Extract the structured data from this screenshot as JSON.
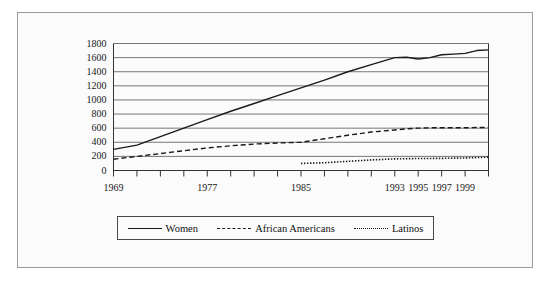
{
  "chart_data": {
    "type": "line",
    "title": "",
    "subtitle": "",
    "xlabel": "",
    "ylabel": "",
    "xlim": [
      1969,
      2001
    ],
    "ylim": [
      0,
      1800
    ],
    "grid": true,
    "grid_axis": "y",
    "legend_position": "bottom",
    "y_ticks": [
      0,
      200,
      400,
      600,
      800,
      1000,
      1200,
      1400,
      1600,
      1800
    ],
    "x_ticks": [
      1969,
      1971,
      1973,
      1975,
      1977,
      1979,
      1981,
      1983,
      1985,
      1987,
      1989,
      1991,
      1993,
      1995,
      1997,
      1999,
      2001
    ],
    "x_tick_labels": [
      "1969",
      "",
      "",
      "",
      "1977",
      "",
      "",
      "",
      "1985",
      "",
      "",
      "",
      "1993",
      "1995",
      "1997",
      "1999",
      ""
    ],
    "x_tick_labels_shown": [
      "1969",
      "1977",
      "1985",
      "1993",
      "1995",
      "1997",
      "1999"
    ],
    "series": [
      {
        "name": "Women",
        "style": "solid",
        "color": "#1a1a1a",
        "x": [
          1969,
          1971,
          1973,
          1975,
          1977,
          1979,
          1981,
          1983,
          1985,
          1987,
          1989,
          1991,
          1993,
          1994,
          1995,
          1996,
          1997,
          1998,
          1999,
          2000,
          2001
        ],
        "values": [
          300,
          360,
          480,
          600,
          720,
          840,
          950,
          1060,
          1170,
          1280,
          1400,
          1500,
          1600,
          1605,
          1580,
          1600,
          1640,
          1650,
          1660,
          1700,
          1710
        ]
      },
      {
        "name": "African Americans",
        "style": "dashed",
        "color": "#1a1a1a",
        "x": [
          1969,
          1971,
          1973,
          1975,
          1977,
          1979,
          1981,
          1983,
          1985,
          1987,
          1989,
          1991,
          1993,
          1994,
          1995,
          1996,
          1997,
          1998,
          1999,
          2000,
          2001
        ],
        "values": [
          160,
          200,
          240,
          280,
          320,
          350,
          375,
          390,
          400,
          450,
          500,
          545,
          575,
          590,
          600,
          605,
          605,
          605,
          605,
          610,
          610
        ]
      },
      {
        "name": "Latinos",
        "style": "dotted",
        "color": "#1a1a1a",
        "x": [
          1985,
          1987,
          1989,
          1991,
          1993,
          1995,
          1997,
          1999,
          2001
        ],
        "values": [
          100,
          110,
          130,
          150,
          165,
          170,
          172,
          178,
          190
        ]
      }
    ]
  },
  "legend": {
    "items": [
      {
        "label": "Women",
        "style": "solid"
      },
      {
        "label": "African Americans",
        "style": "dashed"
      },
      {
        "label": "Latinos",
        "style": "dotted"
      }
    ]
  },
  "axes": {
    "y_labels": [
      "1800",
      "1600",
      "1400",
      "1200",
      "1000",
      "800",
      "600",
      "400",
      "200",
      "0"
    ],
    "x_labels": [
      "1969",
      "1977",
      "1985",
      "1993",
      "1995",
      "1997",
      "1999"
    ]
  }
}
